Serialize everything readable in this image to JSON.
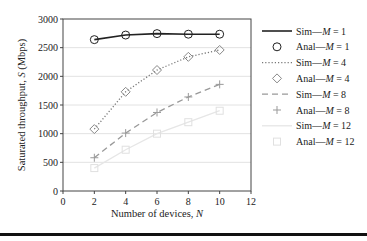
{
  "chart_data": {
    "type": "line",
    "title": "",
    "xlabel": "Number of devices, N",
    "ylabel": "Saturated throughput, S (Mbps)",
    "xlim": [
      0,
      12
    ],
    "ylim": [
      0,
      3000
    ],
    "xticks": [
      0,
      2,
      4,
      6,
      8,
      10,
      12
    ],
    "yticks": [
      0,
      500,
      1000,
      1500,
      2000,
      2500,
      3000
    ],
    "grid": "horizontal",
    "legend_position": "right",
    "x": [
      2,
      4,
      6,
      8,
      10
    ],
    "series": [
      {
        "name": "Sim—M = 1",
        "kind": "line",
        "style": "solid",
        "color": "#222222",
        "values": [
          2640,
          2720,
          2745,
          2735,
          2735
        ]
      },
      {
        "name": "Anal—M = 1",
        "kind": "marker",
        "marker": "circle",
        "color": "#222222",
        "values": [
          2640,
          2720,
          2745,
          2735,
          2735
        ]
      },
      {
        "name": "Sim—M = 4",
        "kind": "line",
        "style": "dotted",
        "color": "#777777",
        "values": [
          1080,
          1730,
          2110,
          2340,
          2460
        ]
      },
      {
        "name": "Anal—M = 4",
        "kind": "marker",
        "marker": "diamond",
        "color": "#888888",
        "values": [
          1080,
          1730,
          2110,
          2340,
          2460
        ]
      },
      {
        "name": "Sim—M = 8",
        "kind": "line",
        "style": "dashed",
        "color": "#999999",
        "values": [
          580,
          1010,
          1370,
          1640,
          1860
        ]
      },
      {
        "name": "Anal—M = 8",
        "kind": "marker",
        "marker": "plus",
        "color": "#999999",
        "values": [
          580,
          1010,
          1370,
          1640,
          1860
        ]
      },
      {
        "name": "Sim—M = 12",
        "kind": "line",
        "style": "solid",
        "color": "#e6e6e6",
        "values": [
          400,
          720,
          1000,
          1200,
          1400
        ]
      },
      {
        "name": "Anal—M = 12",
        "kind": "marker",
        "marker": "square",
        "color": "#e0e0e0",
        "values": [
          400,
          720,
          1000,
          1200,
          1400
        ]
      }
    ]
  },
  "legend": {
    "items": [
      {
        "label": "Sim—",
        "italic": "M",
        "suffix": " = 1"
      },
      {
        "label": "Anal—",
        "italic": "M",
        "suffix": " = 1"
      },
      {
        "label": "Sim—",
        "italic": "M",
        "suffix": " = 4"
      },
      {
        "label": "Anal—",
        "italic": "M",
        "suffix": " = 4"
      },
      {
        "label": "Sim—",
        "italic": "M",
        "suffix": " = 8"
      },
      {
        "label": "Anal—",
        "italic": "M",
        "suffix": " = 8"
      },
      {
        "label": "Sim—",
        "italic": "M",
        "suffix": " = 12"
      },
      {
        "label": "Anal—",
        "italic": "M",
        "suffix": " = 12"
      }
    ]
  },
  "axes": {
    "x_title_main": "Number of devices, ",
    "x_title_var": "N",
    "y_title_main": "Saturated throughput, ",
    "y_title_var": "S",
    "y_title_unit": " (Mbps)"
  }
}
